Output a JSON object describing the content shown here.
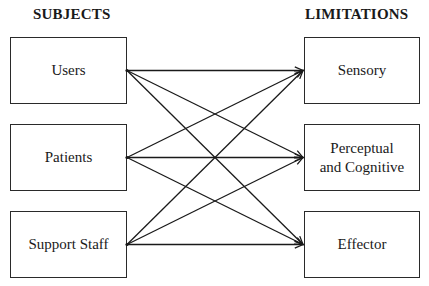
{
  "headings": {
    "left": "SUBJECTS",
    "right": "LIMITATIONS"
  },
  "subjects": [
    {
      "label": "Users"
    },
    {
      "label": "Patients"
    },
    {
      "label": "Support Staff"
    }
  ],
  "limitations": [
    {
      "label": "Sensory"
    },
    {
      "label": "Perceptual\nand Cognitive"
    },
    {
      "label": "Effector"
    }
  ],
  "connections": [
    {
      "from": 0,
      "to": 0
    },
    {
      "from": 0,
      "to": 1
    },
    {
      "from": 0,
      "to": 2
    },
    {
      "from": 1,
      "to": 0
    },
    {
      "from": 1,
      "to": 1
    },
    {
      "from": 1,
      "to": 2
    },
    {
      "from": 2,
      "to": 0
    },
    {
      "from": 2,
      "to": 1
    },
    {
      "from": 2,
      "to": 2
    }
  ],
  "colors": {
    "line": "#1a1a1a",
    "border": "#2a2a2a"
  }
}
